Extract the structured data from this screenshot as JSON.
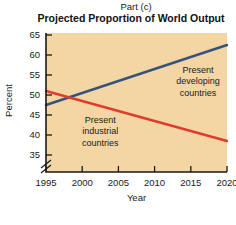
{
  "header": {
    "part_label": "Part (c)",
    "title": "Projected Proportion of World Output"
  },
  "chart_data": {
    "type": "line",
    "title": "Projected Proportion of World Output",
    "xlabel": "Year",
    "ylabel": "Percent",
    "xlim": [
      1995,
      2020
    ],
    "ylim": [
      35,
      65
    ],
    "x_ticks": [
      1995,
      2000,
      2005,
      2010,
      2015,
      2020
    ],
    "y_ticks": [
      35,
      40,
      45,
      50,
      55,
      60,
      65
    ],
    "axis_break": true,
    "grid": false,
    "plot_bg_color": "#f3d6a4",
    "axis_color": "#1a1a1a",
    "series": [
      {
        "name": "Present developing countries",
        "color": "#36527e",
        "x": [
          1995,
          2020
        ],
        "values": [
          47.5,
          62.5
        ]
      },
      {
        "name": "Present industrial countries",
        "color": "#e23b2e",
        "x": [
          1995,
          2020
        ],
        "values": [
          51,
          38.5
        ]
      }
    ],
    "annotations": [
      {
        "name": "developing-countries-label",
        "lines": [
          "Present",
          "developing",
          "countries"
        ],
        "x": 2016,
        "y": 53.5
      },
      {
        "name": "industrial-countries-label",
        "lines": [
          "Present",
          "industrial",
          "countries"
        ],
        "x": 2002.5,
        "y": 41
      }
    ]
  }
}
